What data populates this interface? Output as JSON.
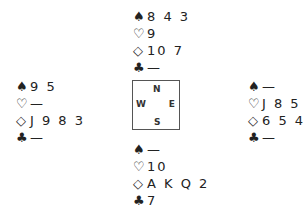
{
  "suits": {
    "spades": "♠",
    "hearts": "♡",
    "diamonds": "◇",
    "clubs": "♣"
  },
  "compass": {
    "north": "N",
    "south": "S",
    "west": "W",
    "east": "E"
  },
  "hands": {
    "north": {
      "spades": "8 4 3",
      "hearts": "9",
      "diamonds": "10 7",
      "clubs": "—"
    },
    "west": {
      "spades": "9 5",
      "hearts": "—",
      "diamonds": "J 9 8 3",
      "clubs": "—"
    },
    "east": {
      "spades": "—",
      "hearts": "J 8 5",
      "diamonds": "6 5 4",
      "clubs": "—"
    },
    "south": {
      "spades": "—",
      "hearts": "10",
      "diamonds": "A K Q 2",
      "clubs": "7"
    }
  }
}
